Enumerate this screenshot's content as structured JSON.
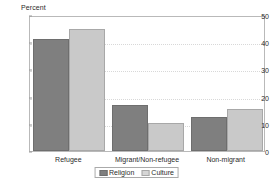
{
  "chart_data": {
    "type": "bar",
    "title": "",
    "subtitle": "",
    "xlabel": "",
    "ylabel": "Percent",
    "unit_label": "Percent",
    "categories": [
      "Refugee",
      "Migrant/Non-refugee",
      "Non-migrant"
    ],
    "series": [
      {
        "name": "Religion",
        "values": [
          41,
          17,
          12.5
        ],
        "color": "#7f7f7f"
      },
      {
        "name": "Culture",
        "values": [
          45,
          10.4,
          15.5
        ],
        "color": "#c9c9c9"
      }
    ],
    "ylim": [
      0,
      50
    ],
    "yticks": [
      0,
      10,
      20,
      30,
      40,
      50
    ],
    "ytick_labels": [
      "0",
      "10",
      "20",
      "30",
      "40",
      "50"
    ],
    "grid": "horizontal-dotted",
    "legend_position": "bottom-center",
    "legend": [
      "Religion",
      "Culture"
    ]
  },
  "legend": {
    "religion_label": "Religion",
    "culture_label": "Culture"
  },
  "axis": {
    "unit": "Percent"
  }
}
